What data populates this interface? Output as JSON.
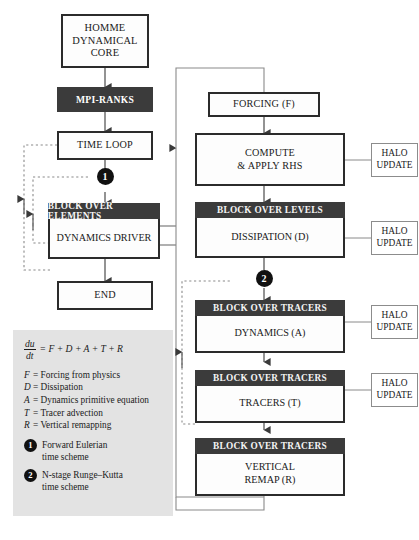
{
  "diagram": {
    "colors": {
      "block_header": "#3b3b3b",
      "node_border": "#2b2b2b",
      "legend_background": "#e3e3e3",
      "marker_fill": "#111111",
      "halo_border": "#8c8c8c"
    }
  },
  "left_column": {
    "homme_core": "HOMME\nDYNAMICAL\nCORE",
    "homme_core_lines": [
      "HOMME",
      "DYNAMICAL",
      "CORE"
    ],
    "mpi_ranks": "MPI-RANKS",
    "time_loop": "TIME LOOP",
    "marker_one": "1",
    "block_over_elements": {
      "header": "BLOCK OVER ELEMENTS",
      "body": "DYNAMICS DRIVER"
    },
    "end": "END"
  },
  "right_column": {
    "forcing": "FORCING (F)",
    "compute_rhs_lines": [
      "COMPUTE",
      "& APPLY RHS"
    ],
    "block_over_levels": {
      "header": "BLOCK OVER LEVELS",
      "body": "DISSIPATION (D)"
    },
    "marker_two": "2",
    "block_tracers_dynamics": {
      "header": "BLOCK OVER TRACERS",
      "body": "DYNAMICS (A)"
    },
    "block_tracers_tracers": {
      "header": "BLOCK OVER TRACERS",
      "body": "TRACERS (T)"
    },
    "block_tracers_remap": {
      "header": "BLOCK OVER TRACERS",
      "body_lines": [
        "VERTICAL",
        "REMAP (R)"
      ]
    },
    "halo_updates": [
      {
        "lines": [
          "HALO",
          "UPDATE"
        ]
      },
      {
        "lines": [
          "HALO",
          "UPDATE"
        ]
      },
      {
        "lines": [
          "HALO",
          "UPDATE"
        ]
      },
      {
        "lines": [
          "HALO",
          "UPDATE"
        ]
      }
    ]
  },
  "legend": {
    "equation": {
      "numerator": "du",
      "denominator": "dt",
      "rhs": "= F + D + A + T + R"
    },
    "definitions": [
      {
        "symbol": "F",
        "text": "= Forcing from physics"
      },
      {
        "symbol": "D",
        "text": "= Dissipation"
      },
      {
        "symbol": "A",
        "text": "= Dynamics primitive equation"
      },
      {
        "symbol": "T",
        "text": "= Tracer advection"
      },
      {
        "symbol": "R",
        "text": "= Vertical remapping"
      }
    ],
    "schemes": [
      {
        "number": "1",
        "lines": [
          "Forward Eulerian",
          "time scheme"
        ]
      },
      {
        "number": "2",
        "lines": [
          "N-stage Runge–Kutta",
          "time scheme"
        ]
      }
    ]
  }
}
